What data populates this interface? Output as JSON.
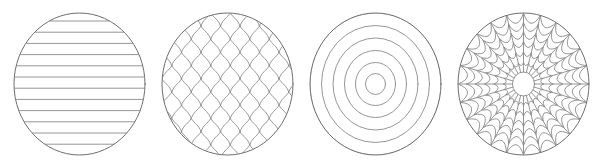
{
  "canvas": {
    "width": 592,
    "height": 168,
    "background_color": "#ffffff"
  },
  "style": {
    "stroke_color": "#8a8a8a",
    "outline_color": "#6e6e6e",
    "stroke_width": 0.9,
    "outline_width": 1.0,
    "fill": "none"
  },
  "swatches": [
    {
      "index": 1,
      "name": "horizontal-stripes",
      "label": "Horizontal Stripes",
      "center_x": 79.5,
      "center_y": 84,
      "radius_x": 65.5,
      "radius_y": 71,
      "pattern": {
        "type": "horizontal-lines",
        "line_count": 12,
        "spacing": 11.2,
        "first_line_y": 21
      }
    },
    {
      "index": 2,
      "name": "knit-chevron",
      "label": "Knit Chevron",
      "center_x": 79.5,
      "center_y": 84,
      "radius_x": 65.5,
      "radius_y": 71,
      "pattern": {
        "type": "knit-stitch-grid",
        "columns": 7,
        "rows": 11,
        "cell_width": 19.5,
        "cell_height": 13.2,
        "stitch_shape": "curved-v"
      }
    },
    {
      "index": 3,
      "name": "concentric-rings",
      "label": "Concentric Rings",
      "center_x": 79.5,
      "center_y": 84,
      "radius_x": 65.5,
      "radius_y": 71,
      "pattern": {
        "type": "concentric-ellipses",
        "ring_count": 6,
        "ring_radii_x": [
          65.5,
          54,
          42.5,
          31,
          20,
          10
        ],
        "ring_radii_y": [
          71,
          58.5,
          46,
          33.5,
          21.5,
          10.5
        ]
      }
    },
    {
      "index": 4,
      "name": "spider-web",
      "label": "Spider Web",
      "center_x": 79.5,
      "center_y": 84,
      "radius_x": 65.5,
      "radius_y": 71,
      "pattern": {
        "type": "radial-web",
        "spoke_count": 24,
        "ring_count": 7,
        "hub_radius_x": 11,
        "hub_radius_y": 12,
        "ring_radii_x": [
          11,
          20,
          29.5,
          39,
          48,
          57,
          65.5
        ],
        "ring_radii_y": [
          12,
          21.5,
          32,
          42.5,
          52,
          61.5,
          71
        ],
        "ring_sag": 0.14
      }
    }
  ]
}
